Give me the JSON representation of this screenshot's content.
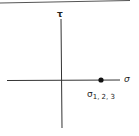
{
  "diagram": {
    "type": "mohr-circle-stress-point",
    "axes": {
      "vertical_label": "τ",
      "horizontal_label": "σ"
    },
    "point": {
      "label_main": "σ",
      "label_sub": "1, 2, 3"
    }
  },
  "colors": {
    "line": "#333333",
    "background": "#ffffff"
  }
}
